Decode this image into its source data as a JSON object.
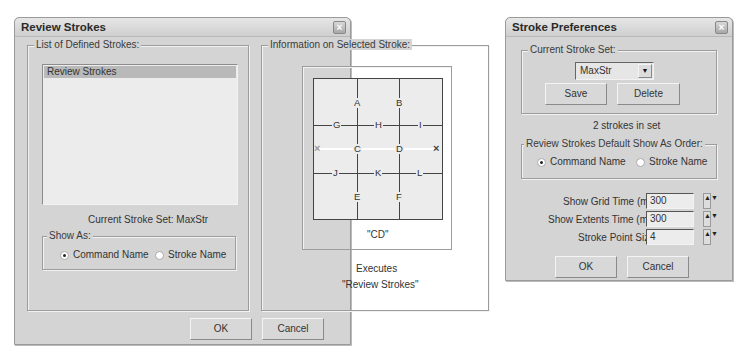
{
  "review_window": {
    "title": "Review Strokes",
    "close_icon": "×",
    "list_group": {
      "label": "List of Defined Strokes:",
      "items": [
        "Review Strokes"
      ],
      "current_set_label": "Current Stroke Set: MaxStr",
      "show_as": {
        "label": "Show As:",
        "options": [
          {
            "label": "Command Name",
            "checked": true
          },
          {
            "label": "Stroke Name",
            "checked": false
          }
        ]
      }
    },
    "info_group": {
      "label": "Information on Selected Stroke:",
      "grid_labels": {
        "A": "A",
        "B": "B",
        "C": "C",
        "D": "D",
        "E": "E",
        "F": "F",
        "G": "G",
        "H": "H",
        "I": "I",
        "J": "J",
        "K": "K",
        "L": "L"
      },
      "start_marker": "×",
      "end_marker": "×",
      "stroke_code": "\"CD\"",
      "executes_label": "Executes",
      "executes_command": "\"Review Strokes\""
    },
    "ok_label": "OK",
    "cancel_label": "Cancel"
  },
  "prefs_window": {
    "title": "Stroke Preferences",
    "close_icon": "×",
    "current_set_group": {
      "label": "Current Stroke Set:",
      "selected_set": "MaxStr",
      "dropdown_icon": "▼",
      "save_label": "Save",
      "delete_label": "Delete",
      "count_text": "2 strokes in set"
    },
    "default_order_group": {
      "label": "Review Strokes Default Show As Order:",
      "options": [
        {
          "label": "Command Name",
          "checked": true
        },
        {
          "label": "Stroke Name",
          "checked": false
        }
      ]
    },
    "fields": [
      {
        "label": "Show Grid Time (ms):",
        "value": "300"
      },
      {
        "label": "Show Extents Time (ms):",
        "value": "300"
      },
      {
        "label": "Stroke Point Size:",
        "value": "4"
      }
    ],
    "spinner_icon": "▲▼",
    "ok_label": "OK",
    "cancel_label": "Cancel"
  }
}
